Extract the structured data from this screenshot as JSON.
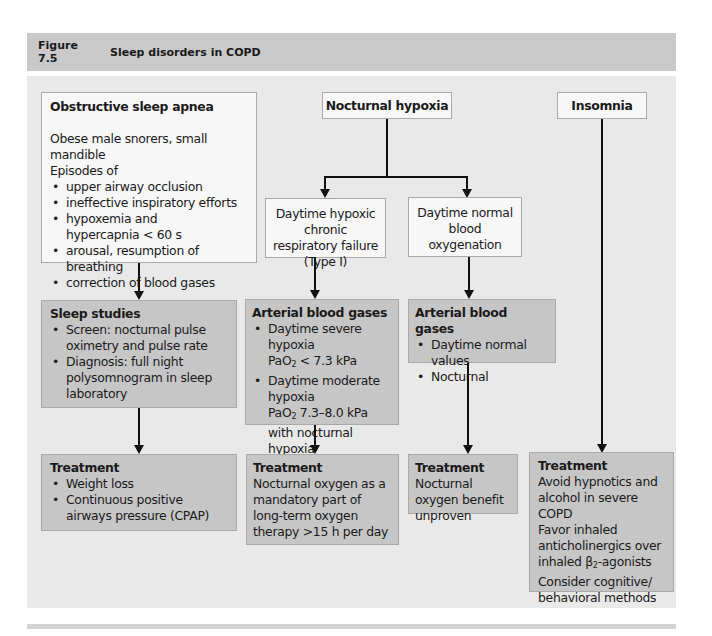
{
  "figure": {
    "number": "Figure 7.5",
    "title": "Sleep disorders in COPD"
  },
  "colors": {
    "header_bg": "#c9c9c9",
    "panel_bg": "#e9e9e9",
    "light_box": "#f7f7f7",
    "dark_box": "#c6c6c6",
    "border": "#a9a9a9",
    "arrow": "#111111"
  },
  "columns": {
    "osa": {
      "title": "Obstructive sleep apnea",
      "intro_line1": "Obese male snorers, small mandible",
      "intro_line2": "Episodes of",
      "items": [
        "upper airway occlusion",
        "ineffective inspiratory efforts",
        "hypoxemia and hypercapnia < 60 s",
        "arousal, resumption of breathing",
        "correction of blood gases"
      ],
      "sleep_studies": {
        "title": "Sleep studies",
        "items": [
          "Screen: nocturnal pulse oximetry and pulse rate",
          "Diagnosis: full night polysomnogram in sleep laboratory"
        ]
      },
      "treatment": {
        "title": "Treatment",
        "items": [
          "Weight loss",
          "Continuous positive airways pressure (CPAP)"
        ]
      }
    },
    "nocturnal_hypoxia": {
      "title": "Nocturnal hypoxia",
      "branch_hypoxic": {
        "label": "Daytime hypoxic chronic respiratory failure (Type I)",
        "abg": {
          "title": "Arterial blood gases",
          "item1_line1": "Daytime severe hypoxia",
          "item1_pao2_prefix": "PaO",
          "item1_pao2_sub": "2",
          "item1_pao2_suffix": " < 7.3 kPa",
          "item2_line1": "Daytime moderate hypoxia",
          "item2_pao2_prefix": "PaO",
          "item2_pao2_sub": "2",
          "item2_pao2_suffix": " 7.3–8.0 kPa with nocturnal hypoxia"
        },
        "treatment": {
          "title": "Treatment",
          "text": "Nocturnal oxygen as a mandatory part of long-term oxygen therapy >15 h per day"
        }
      },
      "branch_normal": {
        "label": "Daytime normal blood oxygenation",
        "abg": {
          "title": "Arterial blood gases",
          "items": [
            "Daytime normal values",
            "Nocturnal"
          ]
        },
        "treatment": {
          "title": "Treatment",
          "text": "Nocturnal oxygen benefit unproven"
        }
      }
    },
    "insomnia": {
      "title": "Insomnia",
      "treatment": {
        "title": "Treatment",
        "line1": "Avoid hypnotics and alcohol in severe COPD",
        "line2_prefix": "Favor inhaled anticholinergics over inhaled β",
        "line2_sub": "2",
        "line2_suffix": "-agonists",
        "line3": "Consider cognitive/ behavioral methods"
      }
    }
  }
}
